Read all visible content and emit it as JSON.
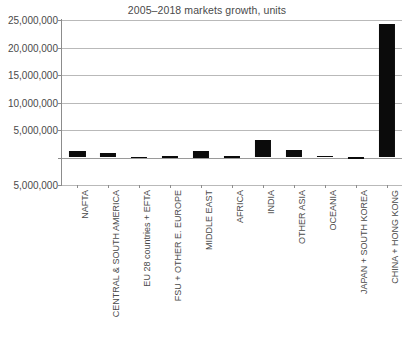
{
  "chart_data": {
    "type": "bar",
    "title": "2005–2018 markets growth, units",
    "xlabel": "",
    "ylabel": "",
    "ylim": [
      -5000000,
      25000000
    ],
    "grid": true,
    "legend": "none",
    "orientation": "vertical",
    "bar_color": "#0b0b0b",
    "y_ticks": [
      "25,000,000",
      "20,000,000",
      "15,000,000",
      "10,000,000",
      "5,000,000",
      "-",
      "5,000,000"
    ],
    "y_tick_values": [
      25000000,
      20000000,
      15000000,
      10000000,
      5000000,
      0,
      -5000000
    ],
    "categories": [
      "NAFTA",
      "CENTRAL & SOUTH AMERICA",
      "EU 28 countries + EFTA",
      "FSU + OTHER E. EUROPE",
      "MIDDLE EAST",
      "AFRICA",
      "INDIA",
      "OTHER ASIA",
      "OCEANIA",
      "JAPAN + SOUTH KOREA",
      "CHINA + HONG KONG"
    ],
    "values": [
      1100000,
      900000,
      150000,
      200000,
      1250000,
      200000,
      3100000,
      1400000,
      350000,
      60000,
      24300000
    ]
  },
  "colors": {
    "bar": "#0b0b0b",
    "gridline": "#b9b9b9",
    "axis": "#8c8c8c",
    "text": "#4a4a4a",
    "background": "#ffffff"
  }
}
